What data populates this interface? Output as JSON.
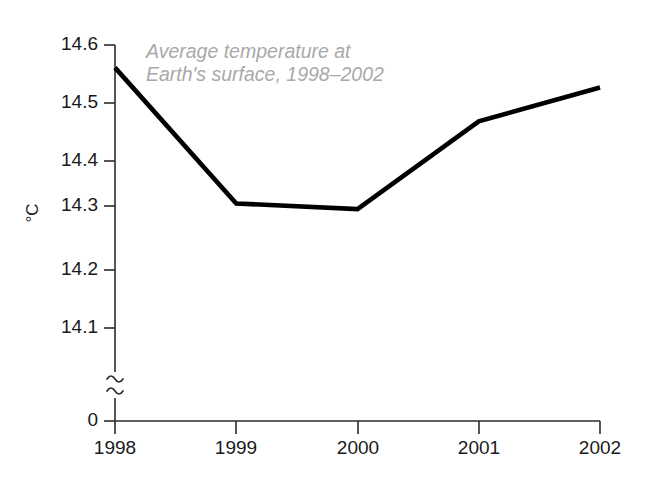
{
  "chart_data": {
    "type": "line",
    "title": "",
    "annotation": {
      "line1": "Average temperature at",
      "line2": "Earth's surface, 1998–2002"
    },
    "xlabel": "",
    "ylabel": "°C",
    "categories": [
      "1998",
      "1999",
      "2000",
      "2001",
      "2002"
    ],
    "x": [
      1998,
      1999,
      2000,
      2001,
      2002
    ],
    "values": [
      14.56,
      14.32,
      14.31,
      14.465,
      14.525
    ],
    "series": [
      {
        "name": "Average temperature at Earth's surface",
        "values": [
          14.56,
          14.32,
          14.31,
          14.465,
          14.525
        ],
        "color": "#000000"
      }
    ],
    "y_ticks": [
      "0",
      "14.1",
      "14.2",
      "14.3",
      "14.4",
      "14.5",
      "14.6"
    ],
    "y_tick_values": [
      0,
      14.1,
      14.2,
      14.3,
      14.4,
      14.5,
      14.6
    ],
    "x_ticks": [
      "1998",
      "1999",
      "2000",
      "2001",
      "2002"
    ],
    "ylim": [
      14.05,
      14.6
    ],
    "y_axis_break": true,
    "y_axis_break_symbol": "≈",
    "grid": false,
    "legend": "none",
    "units": "°C",
    "line_color": "#000000",
    "annotation_color": "#a9a9a9",
    "axis_color": "#2b2b2b",
    "background_color": "#ffffff"
  },
  "axis": {
    "y_title": "°C",
    "y_tick_0": "0",
    "y_tick_141": "14.1",
    "y_tick_142": "14.2",
    "y_tick_143": "14.3",
    "y_tick_144": "14.4",
    "y_tick_145": "14.5",
    "y_tick_146": "14.6",
    "x_tick_1998": "1998",
    "x_tick_1999": "1999",
    "x_tick_2000": "2000",
    "x_tick_2001": "2001",
    "x_tick_2002": "2002"
  },
  "annotation": {
    "line1": "Average temperature at",
    "line2": "Earth's surface, 1998–2002"
  }
}
